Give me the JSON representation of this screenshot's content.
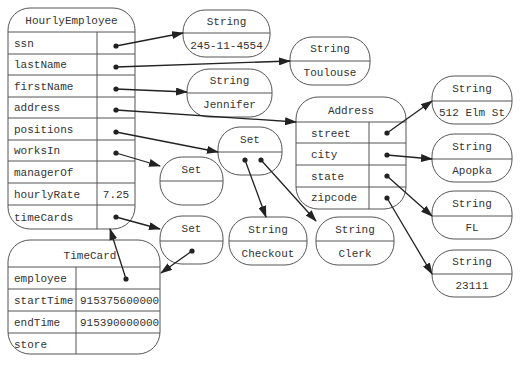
{
  "hourly_employee": {
    "title": "HourlyEmployee",
    "fields": [
      {
        "name": "ssn",
        "value": ""
      },
      {
        "name": "lastName",
        "value": ""
      },
      {
        "name": "firstName",
        "value": ""
      },
      {
        "name": "address",
        "value": ""
      },
      {
        "name": "positions",
        "value": ""
      },
      {
        "name": "worksIn",
        "value": ""
      },
      {
        "name": "managerOf",
        "value": ""
      },
      {
        "name": "hourlyRate",
        "value": "7.25"
      },
      {
        "name": "timeCards",
        "value": ""
      }
    ]
  },
  "address": {
    "title": "Address",
    "fields": [
      {
        "name": "street"
      },
      {
        "name": "city"
      },
      {
        "name": "state"
      },
      {
        "name": "zipcode"
      }
    ]
  },
  "timecard": {
    "title": "TimeCard",
    "fields": [
      {
        "name": "employee",
        "value": ""
      },
      {
        "name": "startTime",
        "value": "915375600000"
      },
      {
        "name": "endTime",
        "value": "915390000000"
      },
      {
        "name": "store",
        "value": ""
      }
    ]
  },
  "strings": {
    "ssn": {
      "type": "String",
      "value": "245-11-4554"
    },
    "lastName": {
      "type": "String",
      "value": "Toulouse"
    },
    "firstName": {
      "type": "String",
      "value": "Jennifer"
    },
    "street": {
      "type": "String",
      "value": "512 Elm St"
    },
    "city": {
      "type": "String",
      "value": "Apopka"
    },
    "state": {
      "type": "String",
      "value": "FL"
    },
    "zipcode": {
      "type": "String",
      "value": "23111"
    },
    "checkout": {
      "type": "String",
      "value": "Checkout"
    },
    "clerk": {
      "type": "String",
      "value": "Clerk"
    }
  },
  "sets": {
    "positions": {
      "type": "Set"
    },
    "worksIn": {
      "type": "Set"
    },
    "timeCards": {
      "type": "Set"
    }
  }
}
